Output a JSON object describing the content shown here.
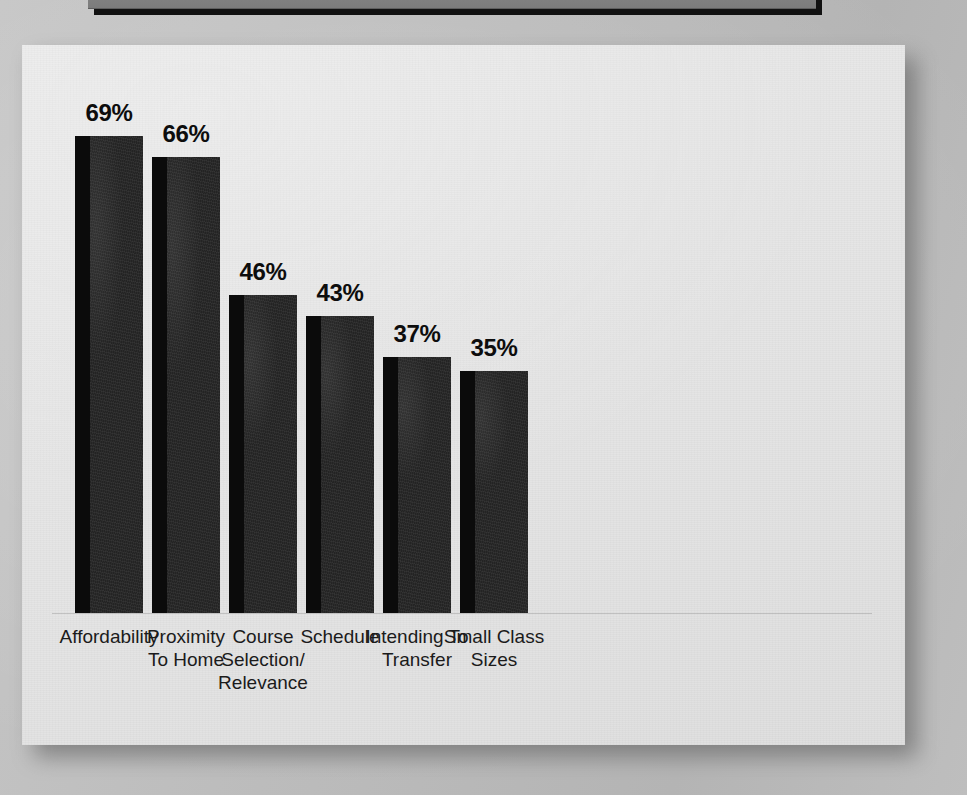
{
  "banner": {
    "title": ""
  },
  "chart_data": {
    "type": "bar",
    "title": "",
    "subtitle": "",
    "xlabel": "",
    "ylabel": "",
    "ylim": [
      0,
      75
    ],
    "grid": false,
    "legend": "none",
    "value_suffix": "%",
    "categories": [
      "Affordability",
      "Proximity\nTo Home",
      "Course\nSelection/\nRelevance",
      "Schedule",
      "Intending To\nTransfer",
      "Small Class\nSizes"
    ],
    "values": [
      69,
      66,
      46,
      43,
      37,
      35
    ],
    "value_labels": [
      "69%",
      "66%",
      "46%",
      "43%",
      "37%",
      "35%"
    ],
    "bars": [
      {
        "label": "Affordability",
        "value": 69,
        "value_label": "69%"
      },
      {
        "label": "Proximity\nTo Home",
        "value": 66,
        "value_label": "66%"
      },
      {
        "label": "Course\nSelection/\nRelevance",
        "value": 46,
        "value_label": "46%"
      },
      {
        "label": "Schedule",
        "value": 43,
        "value_label": "43%"
      },
      {
        "label": "Intending To\nTransfer",
        "value": 37,
        "value_label": "37%"
      },
      {
        "label": "Small Class\nSizes",
        "value": 35,
        "value_label": "35%"
      }
    ],
    "colors": {
      "bar_face": "#262626",
      "bar_side": "#0b0b0b",
      "paper": "#e4e4e4",
      "background": "#bdbdbd",
      "text": "#1b1b1b"
    }
  }
}
